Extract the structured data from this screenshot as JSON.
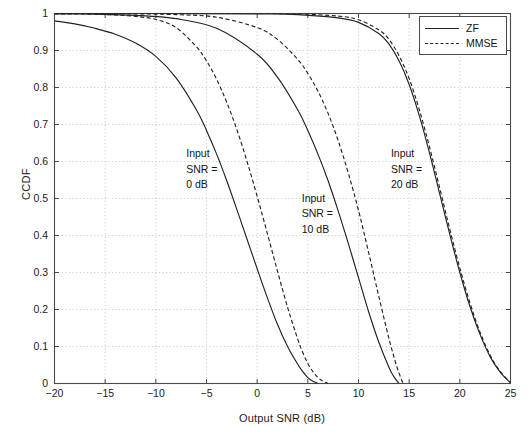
{
  "chart_data": {
    "type": "line",
    "title": "",
    "xlabel": "Output SNR (dB)",
    "ylabel": "CCDF",
    "xlim": [
      -20,
      25
    ],
    "ylim": [
      0,
      1
    ],
    "xticks": [
      "-20",
      "-15",
      "-10",
      "-5",
      "0",
      "5",
      "10",
      "15",
      "20",
      "25"
    ],
    "xtick_values": [
      -20,
      -15,
      -10,
      -5,
      0,
      5,
      10,
      15,
      20,
      25
    ],
    "yticks": [
      "0",
      "0.1",
      "0.2",
      "0.3",
      "0.4",
      "0.5",
      "0.6",
      "0.7",
      "0.8",
      "0.9",
      "1"
    ],
    "ytick_values": [
      0,
      0.1,
      0.2,
      0.3,
      0.4,
      0.5,
      0.6,
      0.7,
      0.8,
      0.9,
      1
    ],
    "grid": true,
    "legend_position": "top-right",
    "legend": [
      {
        "name": "ZF",
        "style": "solid"
      },
      {
        "name": "MMSE",
        "style": "dashed"
      }
    ],
    "annotations": [
      {
        "text": "Input\nSNR =\n0 dB",
        "x": -7.0,
        "y": 0.62
      },
      {
        "text": "Input\nSNR =\n10 dB",
        "x": 4.4,
        "y": 0.5
      },
      {
        "text": "Input\nSNR =\n20 dB",
        "x": 13.2,
        "y": 0.62
      }
    ],
    "series": [
      {
        "name": "ZF, Input SNR = 0 dB",
        "style": "solid",
        "input_snr_db": 0,
        "x": [
          -20,
          -18,
          -16,
          -14,
          -12,
          -10,
          -8,
          -6,
          -5,
          -4,
          -3,
          -2,
          -1,
          0,
          1,
          2,
          3,
          4,
          4.5,
          5,
          5.5,
          6
        ],
        "y": [
          0.98,
          0.972,
          0.96,
          0.944,
          0.92,
          0.884,
          0.826,
          0.74,
          0.684,
          0.62,
          0.548,
          0.47,
          0.39,
          0.31,
          0.232,
          0.16,
          0.1,
          0.052,
          0.032,
          0.016,
          0.006,
          0.0
        ]
      },
      {
        "name": "MMSE, Input SNR = 0 dB",
        "style": "dashed",
        "input_snr_db": 0,
        "x": [
          -20,
          -18,
          -16,
          -14,
          -12,
          -10,
          -8,
          -6,
          -5,
          -4,
          -3,
          -2,
          -1,
          0,
          1,
          2,
          3,
          4,
          4.5,
          5,
          5.5,
          6,
          6.5,
          7
        ],
        "y": [
          0.999,
          0.999,
          0.998,
          0.996,
          0.992,
          0.984,
          0.962,
          0.91,
          0.872,
          0.822,
          0.76,
          0.686,
          0.6,
          0.506,
          0.406,
          0.304,
          0.206,
          0.12,
          0.084,
          0.054,
          0.032,
          0.016,
          0.006,
          0.0
        ]
      },
      {
        "name": "ZF, Input SNR = 10 dB",
        "style": "solid",
        "input_snr_db": 10,
        "x": [
          -20,
          -16,
          -12,
          -8,
          -4,
          0,
          2,
          4,
          5,
          6,
          7,
          8,
          9,
          10,
          11,
          12,
          13,
          13.5,
          14
        ],
        "y": [
          0.999,
          0.998,
          0.995,
          0.986,
          0.96,
          0.89,
          0.828,
          0.74,
          0.684,
          0.62,
          0.548,
          0.466,
          0.378,
          0.286,
          0.194,
          0.112,
          0.044,
          0.018,
          0.0
        ]
      },
      {
        "name": "MMSE, Input SNR = 10 dB",
        "style": "dashed",
        "input_snr_db": 10,
        "x": [
          -20,
          -16,
          -12,
          -8,
          -4,
          0,
          2,
          4,
          5,
          6,
          7,
          8,
          9,
          10,
          11,
          12,
          13,
          13.8,
          14.4
        ],
        "y": [
          1.0,
          1.0,
          0.999,
          0.997,
          0.99,
          0.962,
          0.93,
          0.876,
          0.838,
          0.79,
          0.73,
          0.656,
          0.568,
          0.468,
          0.354,
          0.236,
          0.122,
          0.044,
          0.0
        ]
      },
      {
        "name": "ZF, Input SNR = 20 dB",
        "style": "solid",
        "input_snr_db": 20,
        "x": [
          -20,
          -10,
          0,
          4,
          8,
          10,
          12,
          13,
          14,
          15,
          16,
          17,
          18,
          19,
          20,
          21,
          22,
          23,
          24,
          25
        ],
        "y": [
          1.0,
          1.0,
          0.999,
          0.997,
          0.988,
          0.976,
          0.946,
          0.918,
          0.872,
          0.808,
          0.724,
          0.624,
          0.514,
          0.404,
          0.3,
          0.208,
          0.132,
          0.072,
          0.03,
          0.002
        ]
      },
      {
        "name": "MMSE, Input SNR = 20 dB",
        "style": "dashed",
        "input_snr_db": 20,
        "x": [
          -20,
          -10,
          0,
          4,
          8,
          10,
          12,
          13,
          14,
          15,
          16,
          17,
          18,
          19,
          20,
          21,
          22,
          23,
          24,
          25
        ],
        "y": [
          1.0,
          1.0,
          1.0,
          0.999,
          0.993,
          0.983,
          0.956,
          0.93,
          0.886,
          0.824,
          0.74,
          0.64,
          0.53,
          0.418,
          0.312,
          0.218,
          0.138,
          0.076,
          0.032,
          0.002
        ]
      }
    ]
  },
  "colors": {
    "line": "#222222",
    "axis": "#4a4a4a",
    "grid": "#b5b5b5",
    "background": "#ffffff"
  }
}
